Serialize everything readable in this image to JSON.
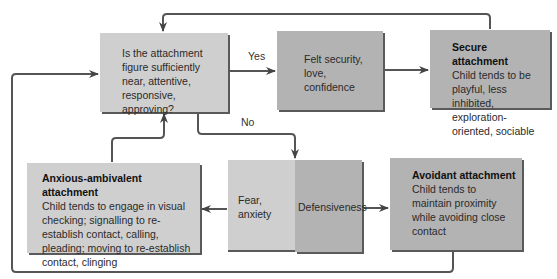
{
  "diagram": {
    "question": {
      "text": "Is the attachment figure sufficiently near, attentive, responsive, approving?"
    },
    "yes_label": "Yes",
    "no_label": "No",
    "felt_security": {
      "text": "Felt security, love, confidence"
    },
    "secure": {
      "title": "Secure attachment",
      "text": "Child tends to be playful, less inhibited, exploration-oriented, sociable"
    },
    "fear": {
      "text": "Fear, anxiety"
    },
    "defensiveness": {
      "text": "Defensiveness"
    },
    "anxious": {
      "title": "Anxious-ambivalent attachment",
      "text": "Child tends to engage in visual checking; signalling to re-establish contact, calling, pleading; moving to re-establish contact, clinging"
    },
    "avoidant": {
      "title": "Avoidant attachment",
      "text": "Child tends to maintain proximity while avoiding close contact"
    },
    "colors": {
      "box_light": "#cfcfcf",
      "box_mid": "#b3b3b3",
      "line": "#555555"
    }
  }
}
